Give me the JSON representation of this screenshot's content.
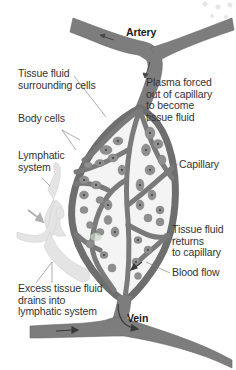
{
  "diagram": {
    "colors": {
      "vessel": "#7d7d7d",
      "vessel_dark": "#5a5a5a",
      "cell": "#8f8f8f",
      "cell_nucleus": "#333333",
      "tissue_fluid": "#f4f4f4",
      "lymphatic": "#e4e4e4",
      "label_text": "#333333",
      "leader_line": "#777777"
    },
    "labels": {
      "artery": "Artery",
      "vein": "Vein",
      "tissue_fluid_surrounding": "Tissue fluid\nsurrounding cells",
      "plasma_forced": "Plasma forced\nout of capillary\nto become\ntissue fluid",
      "body_cells": "Body cells",
      "lymphatic_system": "Lymphatic\nsystem",
      "capillary": "Capillary",
      "tissue_fluid_returns": "Tissue fluid\nreturns\nto capillary",
      "blood_flow": "Blood flow",
      "excess_fluid": "Excess tissue fluid\ndrains into\nlymphatic system"
    }
  }
}
